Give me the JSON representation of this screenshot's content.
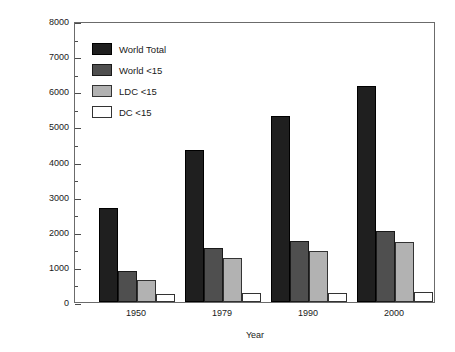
{
  "chart_data": {
    "type": "bar",
    "title": "",
    "xlabel": "Year",
    "ylabel": "Population (Millions)",
    "categories": [
      "1950",
      "1979",
      "1990",
      "2000"
    ],
    "series": [
      {
        "name": "World Total",
        "color": "#1f1f1f",
        "values": [
          2680,
          4320,
          5300,
          6160
        ]
      },
      {
        "name": "World <15",
        "color": "#4f4f4f",
        "values": [
          880,
          1530,
          1730,
          2030
        ]
      },
      {
        "name": "LDC <15",
        "color": "#b2b2b2",
        "values": [
          640,
          1250,
          1460,
          1700
        ]
      },
      {
        "name": "DC <15",
        "color": "#ffffff",
        "values": [
          240,
          270,
          260,
          290
        ]
      }
    ],
    "ylim": [
      0,
      8000
    ],
    "ytick_labels": [
      "0",
      "1000",
      "2000",
      "3000",
      "4000",
      "5000",
      "6000",
      "7000",
      "8000"
    ],
    "ytick_values": [
      0,
      1000,
      2000,
      3000,
      4000,
      5000,
      6000,
      7000,
      8000
    ],
    "yminor_interval": 500,
    "grid": false,
    "legend_position": "upper-left",
    "frame": true
  },
  "legend": {
    "entries": [
      {
        "label": "World Total"
      },
      {
        "label": "World <15"
      },
      {
        "label": "LDC <15"
      },
      {
        "label": "DC <15"
      }
    ]
  }
}
